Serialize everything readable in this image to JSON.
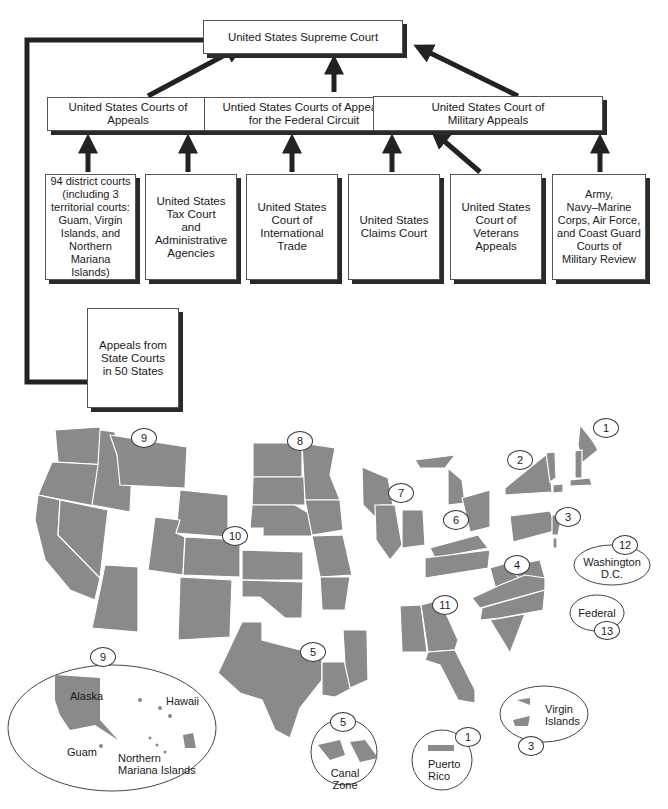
{
  "diagram": {
    "title_box": "United States Supreme Court",
    "tier2": [
      {
        "id": "courts-of-appeals",
        "label": "United States Courts of Appeals"
      },
      {
        "id": "federal-circuit",
        "label": "Untied States Courts of Appeals\nfor the Federal Circuit"
      },
      {
        "id": "military-appeals",
        "label": "United States Court of\nMilitary Appeals"
      }
    ],
    "tier3": [
      {
        "id": "district-courts",
        "label": "94 district courts\n(including 3\nterritorial courts:\nGuam, Virgin\nIslands, and\nNorthern\nMariana Islands)"
      },
      {
        "id": "tax-court",
        "label": "United States\nTax Court\nand\nAdministrative\nAgencies"
      },
      {
        "id": "international-trade",
        "label": "United States\nCourt of\nInternational\nTrade"
      },
      {
        "id": "claims-court",
        "label": "United States\nClaims Court"
      },
      {
        "id": "veterans-appeals",
        "label": "United States\nCourt of\nVeterans\nAppeals"
      },
      {
        "id": "military-review",
        "label": "Army,\nNavy–Marine\nCorps, Air Force,\nand Coast Guard\nCourts of\nMilitary Review"
      }
    ],
    "state_box": "Appeals from\nState Courts\nin 50 States"
  },
  "map": {
    "circuit_labels": [
      "1",
      "2",
      "3",
      "4",
      "5",
      "6",
      "7",
      "8",
      "9",
      "10",
      "11",
      "12",
      "13"
    ],
    "dc": {
      "num": "12",
      "label": "Washington\nD.C."
    },
    "federal": {
      "num": "13",
      "label": "Federal"
    },
    "insets": {
      "pacific": {
        "num": "9",
        "alaska": "Alaska",
        "hawaii": "Hawaii",
        "guam": "Guam",
        "nmi": "Northern\nMariana Islands"
      },
      "canal": {
        "num": "5",
        "label": "Canal Zone"
      },
      "puerto_rico": {
        "num": "1",
        "label": "Puerto\nRico"
      },
      "virgin_islands": {
        "num": "3",
        "label": "Virgin\nIslands"
      }
    }
  },
  "colors": {
    "land": "#8a8a8a",
    "border": "#ffffff",
    "arrow": "#222222"
  }
}
